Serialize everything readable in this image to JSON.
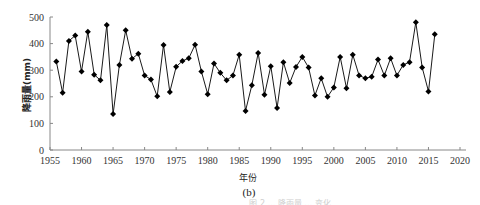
{
  "chart_data": {
    "type": "line",
    "title": "",
    "panel_label": "(b)",
    "xlabel": "年份",
    "ylabel": "降雨量(mm)",
    "xlim": [
      1955,
      2020
    ],
    "ylim": [
      0,
      500
    ],
    "xticks": [
      1955,
      1960,
      1965,
      1970,
      1975,
      1980,
      1985,
      1990,
      1995,
      2000,
      2005,
      2010,
      2015,
      2020
    ],
    "yticks": [
      0,
      100,
      200,
      300,
      400,
      500
    ],
    "grid": false,
    "legend": null,
    "marker": "diamond",
    "line_color": "#1a1a1a",
    "marker_color": "#000000",
    "axis_color": "#888888",
    "series": [
      {
        "name": "降雨量",
        "x": [
          1956,
          1957,
          1958,
          1959,
          1960,
          1961,
          1962,
          1963,
          1964,
          1965,
          1966,
          1967,
          1968,
          1969,
          1970,
          1971,
          1972,
          1973,
          1974,
          1975,
          1976,
          1977,
          1978,
          1979,
          1980,
          1981,
          1982,
          1983,
          1984,
          1985,
          1986,
          1987,
          1988,
          1989,
          1990,
          1991,
          1992,
          1993,
          1994,
          1995,
          1996,
          1997,
          1998,
          1999,
          2000,
          2001,
          2002,
          2003,
          2004,
          2005,
          2006,
          2007,
          2008,
          2009,
          2010,
          2011,
          2012,
          2013,
          2014,
          2015,
          2016
        ],
        "values": [
          333,
          215,
          410,
          430,
          295,
          445,
          283,
          262,
          470,
          135,
          320,
          450,
          343,
          362,
          280,
          265,
          202,
          395,
          218,
          313,
          335,
          345,
          396,
          295,
          210,
          325,
          290,
          262,
          280,
          358,
          147,
          243,
          365,
          208,
          315,
          158,
          330,
          252,
          312,
          350,
          310,
          205,
          270,
          200,
          235,
          350,
          232,
          358,
          280,
          270,
          275,
          340,
          280,
          345,
          280,
          320,
          330,
          480,
          310,
          220,
          435
        ]
      }
    ]
  },
  "caption": {
    "faint_text": "图 2 ... 降雨量 ... 变化"
  }
}
